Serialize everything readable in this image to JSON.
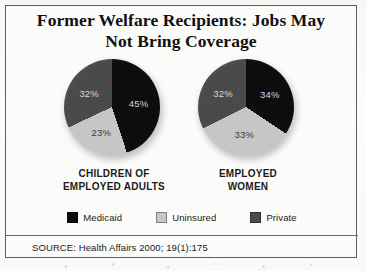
{
  "figure": {
    "title_line1": "Former Welfare Recipients: Jobs May",
    "title_line2": "Not Bring Coverage",
    "source": "SOURCE: Health Affairs 2000; 19(1):175"
  },
  "legend": {
    "items": [
      {
        "label": "Medicaid",
        "color": "#0d0d0d"
      },
      {
        "label": "Uninsured",
        "color": "#c6c6c6"
      },
      {
        "label": "Private",
        "color": "#4a4a4a"
      }
    ]
  },
  "charts": [
    {
      "caption_line1": "CHILDREN OF",
      "caption_line2": "EMPLOYED ADULTS",
      "slices": [
        {
          "label": "Medicaid",
          "value": 45,
          "display": "45%",
          "color": "#0d0d0d"
        },
        {
          "label": "Uninsured",
          "value": 23,
          "display": "23%",
          "color": "#c6c6c6"
        },
        {
          "label": "Private",
          "value": 32,
          "display": "32%",
          "color": "#4a4a4a"
        }
      ]
    },
    {
      "caption_line1": "EMPLOYED",
      "caption_line2": "WOMEN",
      "slices": [
        {
          "label": "Medicaid",
          "value": 34,
          "display": "34%",
          "color": "#0d0d0d"
        },
        {
          "label": "Uninsured",
          "value": 33,
          "display": "33%",
          "color": "#c6c6c6"
        },
        {
          "label": "Private",
          "value": 32,
          "display": "32%",
          "color": "#4a4a4a"
        }
      ]
    }
  ],
  "chart_data": {
    "type": "pie",
    "title": "Former Welfare Recipients: Jobs May Not Bring Coverage",
    "subtitle": "",
    "xlabel": "",
    "ylabel": "",
    "units": "percent",
    "grid": false,
    "legend_position": "bottom",
    "legend_entries": [
      "Medicaid",
      "Uninsured",
      "Private"
    ],
    "categories": [
      "Medicaid",
      "Uninsured",
      "Private"
    ],
    "series": [
      {
        "name": "CHILDREN OF EMPLOYED ADULTS",
        "values": [
          45,
          23,
          32
        ]
      },
      {
        "name": "EMPLOYED WOMEN",
        "values": [
          34,
          33,
          32
        ]
      }
    ],
    "annotations": [
      "SOURCE: Health Affairs 2000; 19(1):175"
    ],
    "colors": {
      "Medicaid": "#0d0d0d",
      "Uninsured": "#c6c6c6",
      "Private": "#4a4a4a"
    }
  }
}
